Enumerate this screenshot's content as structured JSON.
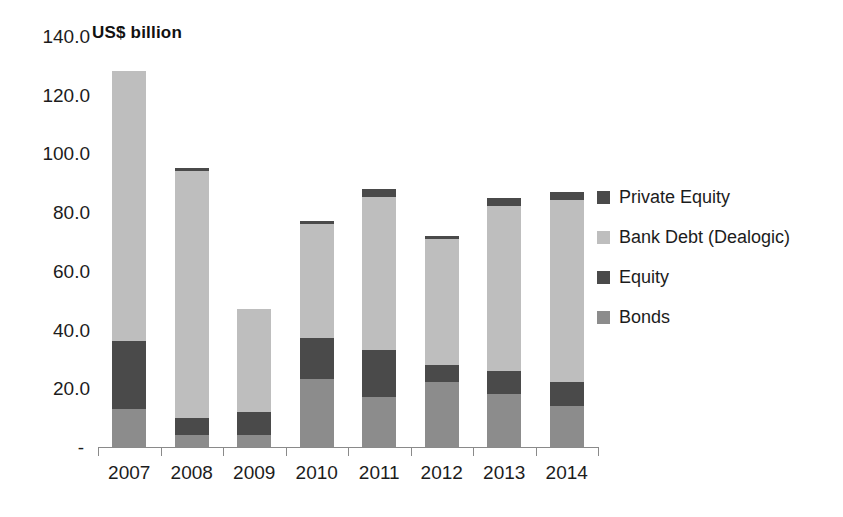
{
  "chart_data": {
    "type": "bar",
    "subtype": "stacked-vertical-bar",
    "title": "US$ billion",
    "xlabel": "",
    "ylabel": "",
    "ylim": [
      0,
      140
    ],
    "ytick_values": [
      140,
      120,
      100,
      80,
      60,
      40,
      20,
      0
    ],
    "ytick_labels": [
      "140.0",
      "120.0",
      "100.0",
      "80.0",
      "60.0",
      "40.0",
      "20.0",
      "-"
    ],
    "grid": false,
    "legend_position": "right",
    "categories": [
      "2007",
      "2008",
      "2009",
      "2010",
      "2011",
      "2012",
      "2013",
      "2014"
    ],
    "stack_order_bottom_to_top": [
      "Bonds",
      "Equity",
      "Bank Debt (Dealogic)",
      "Private Equity"
    ],
    "series": [
      {
        "name": "Bonds",
        "color": "#8c8c8c",
        "values": [
          13.0,
          4.0,
          4.0,
          23.0,
          17.0,
          22.0,
          18.0,
          14.0
        ]
      },
      {
        "name": "Equity",
        "color": "#4a4a4a",
        "values": [
          23.0,
          6.0,
          8.0,
          14.0,
          16.0,
          6.0,
          8.0,
          8.0
        ]
      },
      {
        "name": "Bank Debt (Dealogic)",
        "color": "#bebebe",
        "values": [
          92.0,
          84.0,
          35.0,
          39.0,
          52.0,
          43.0,
          56.0,
          62.0
        ]
      },
      {
        "name": "Private Equity",
        "color": "#4a4a4a",
        "values": [
          0.0,
          1.0,
          0.0,
          1.0,
          3.0,
          1.0,
          3.0,
          3.0
        ]
      }
    ],
    "totals": [
      128.0,
      95.0,
      47.0,
      77.0,
      88.0,
      72.0,
      85.0,
      87.0
    ]
  },
  "legend": {
    "items": [
      {
        "label": "Private Equity",
        "color": "#4a4a4a"
      },
      {
        "label": "Bank Debt (Dealogic)",
        "color": "#bebebe"
      },
      {
        "label": "Equity",
        "color": "#4a4a4a"
      },
      {
        "label": "Bonds",
        "color": "#8c8c8c"
      }
    ]
  },
  "axis": {
    "line_color": "#8a8a8a",
    "text_color": "#1c1c1c"
  }
}
